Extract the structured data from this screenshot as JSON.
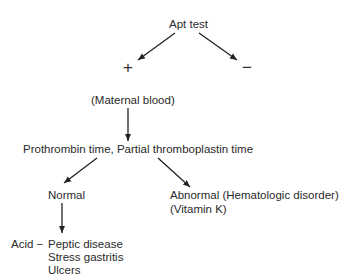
{
  "diagram": {
    "type": "flowchart",
    "root": {
      "label": "Apt test"
    },
    "branches": {
      "positive": {
        "symbol": "+"
      },
      "negative": {
        "symbol": "−"
      }
    },
    "maternal": {
      "label": "(Maternal blood)"
    },
    "coag_test": {
      "label": "Prothrombin time, Partial thromboplastin time"
    },
    "normal": {
      "label": "Normal"
    },
    "abnormal": {
      "label": "Abnormal (Hematologic disorder)",
      "sublabel": "(Vitamin K)"
    },
    "acid": {
      "prefix": "Acid −",
      "items": [
        "Peptic disease",
        "Stress gastritis",
        "Ulcers"
      ]
    },
    "edges": [
      {
        "from": "Apt test",
        "to": "+"
      },
      {
        "from": "Apt test",
        "to": "−"
      },
      {
        "from": "(Maternal blood)",
        "to": "Prothrombin time, Partial thromboplastin time"
      },
      {
        "from": "Prothrombin time, Partial thromboplastin time",
        "to": "Normal"
      },
      {
        "from": "Prothrombin time, Partial thromboplastin time",
        "to": "Abnormal (Hematologic disorder)"
      },
      {
        "from": "Normal",
        "to": "Acid − Peptic disease"
      }
    ]
  }
}
